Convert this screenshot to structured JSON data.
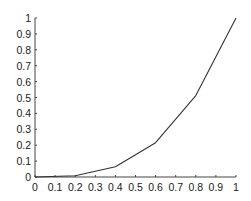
{
  "chart_data": {
    "type": "line",
    "title": "",
    "xlabel": "",
    "ylabel": "",
    "xlim": [
      0,
      1
    ],
    "ylim": [
      0,
      1
    ],
    "grid": false,
    "legend": null,
    "x_ticks": [
      "0",
      "0.1",
      "0.2",
      "0.3",
      "0.4",
      "0.5",
      "0.6",
      "0.7",
      "0.8",
      "0.9",
      "1"
    ],
    "y_ticks": [
      "0",
      "0.1",
      "0.2",
      "0.3",
      "0.4",
      "0.5",
      "0.6",
      "0.7",
      "0.8",
      "0.9",
      "1"
    ],
    "series": [
      {
        "name": "line",
        "color": "#333333",
        "x": [
          0,
          0.2,
          0.4,
          0.6,
          0.8,
          1.0
        ],
        "y": [
          0,
          0.008,
          0.064,
          0.216,
          0.512,
          1.0
        ]
      }
    ]
  },
  "colors": {
    "axis": "#444444",
    "line": "#333333",
    "text": "#1a1a1a"
  }
}
